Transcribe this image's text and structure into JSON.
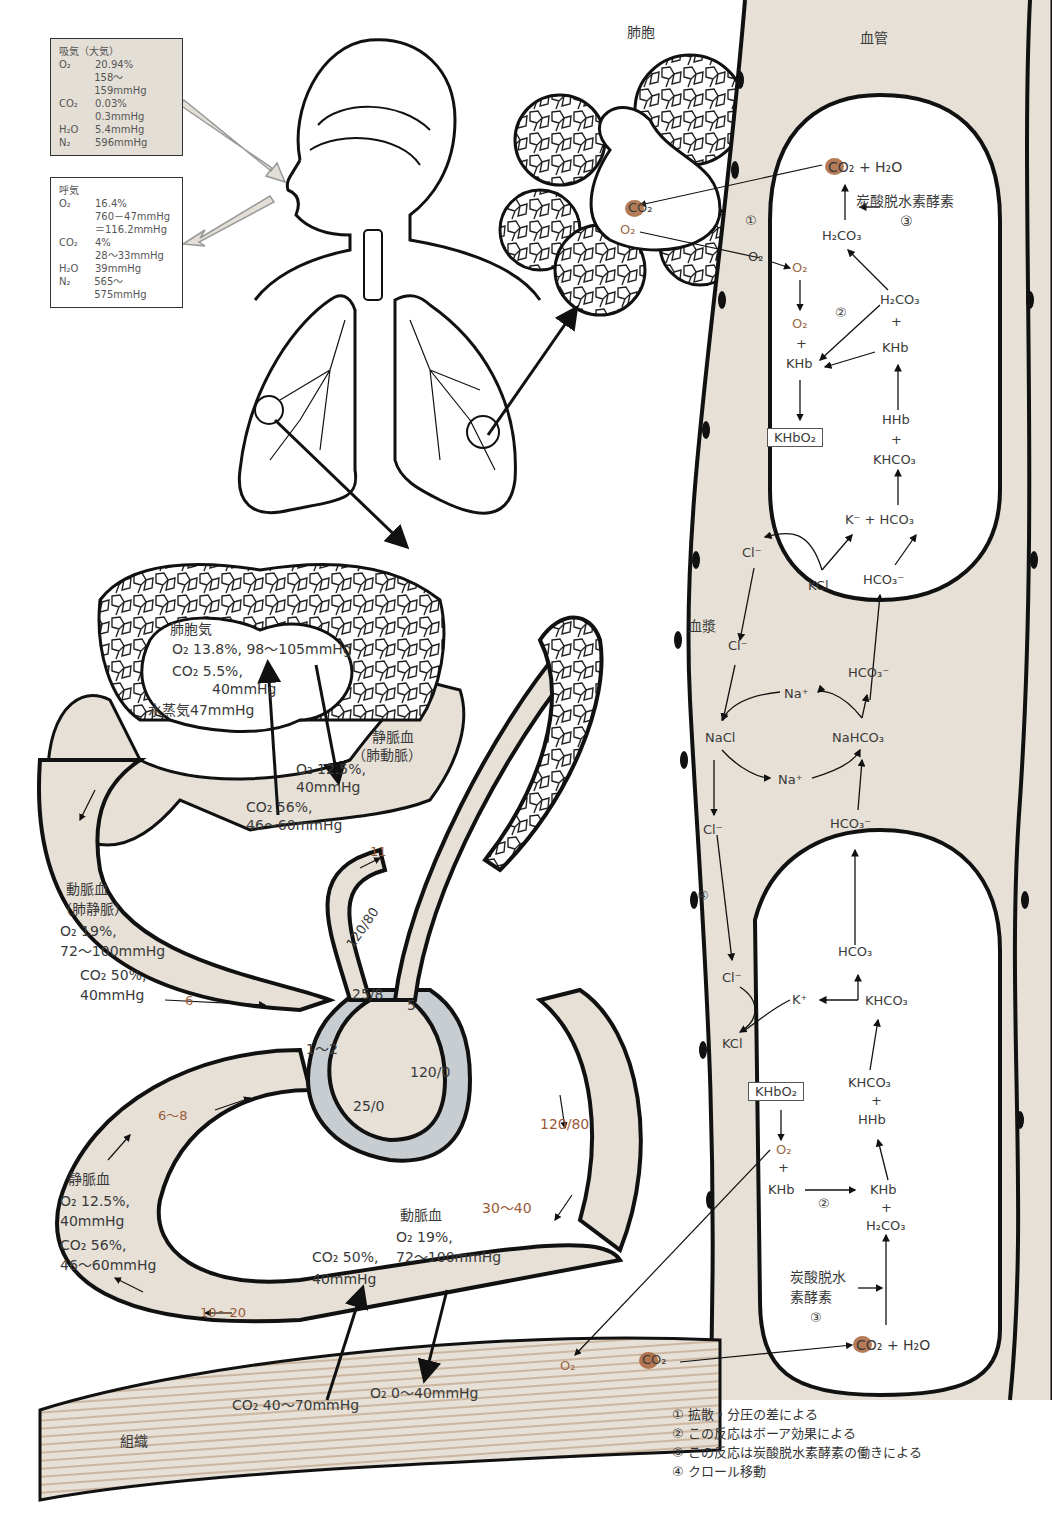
{
  "inhale_box": {
    "title": "吸気（大気）",
    "rows": [
      {
        "k": "O₂",
        "v": "20.94%"
      },
      {
        "k": "",
        "v": "158～159mmHg"
      },
      {
        "k": "CO₂",
        "v": "0.03%"
      },
      {
        "k": "",
        "v": "0.3mmHg"
      },
      {
        "k": "H₂O",
        "v": "5.4mmHg"
      },
      {
        "k": "N₂",
        "v": "596mmHg"
      }
    ]
  },
  "exhale_box": {
    "title": "呼気",
    "rows": [
      {
        "k": "O₂",
        "v": "16.4%"
      },
      {
        "k": "",
        "v": "760－47mmHg"
      },
      {
        "k": "",
        "v": "＝116.2mmHg"
      },
      {
        "k": "CO₂",
        "v": "4%"
      },
      {
        "k": "",
        "v": "28～33mmHg"
      },
      {
        "k": "H₂O",
        "v": "39mmHg"
      },
      {
        "k": "N₂",
        "v": "565～575mmHg"
      }
    ]
  },
  "top_labels": {
    "alveolus": "肺胞",
    "vessel": "血管",
    "plasma": "血漿"
  },
  "alveolar_air": {
    "title": "肺胞気",
    "o2": "O₂ 13.8%, 98～105mmHg",
    "co2": "CO₂ 5.5%,",
    "co2_mmhg": "40mmHg",
    "water": "水蒸気47mmHg"
  },
  "pulmonary_artery": {
    "title": "静脈血",
    "sub": "（肺動脈）",
    "o2": "O₂ 12.5%,",
    "o2_mmhg": "40mmHg",
    "co2": "CO₂ 56%,",
    "co2_mmhg": "46～60mmHg"
  },
  "pulmonary_vein": {
    "title": "動脈血",
    "sub": "（肺静脈）",
    "o2": "O₂ 19%,",
    "o2_mmhg": "72～100mmHg",
    "co2": "CO₂ 50%,",
    "co2_mmhg": "40mmHg"
  },
  "systemic_vein": {
    "title": "静脈血",
    "o2": "O₂ 12.5%,",
    "o2_mmhg": "40mmHg",
    "co2": "CO₂ 56%,",
    "co2_mmhg": "46～60mmHg"
  },
  "systemic_artery": {
    "title": "動脈血",
    "o2": "O₂ 19%,",
    "o2_mmhg": "72～100mmHg",
    "co2": "CO₂ 50%,",
    "co2_mmhg": "40mmHg"
  },
  "tissue": {
    "label": "組織",
    "co2": "CO₂ 40～70mmHg",
    "o2": "O₂ 0～40mmHg"
  },
  "pressures": {
    "p11": "11",
    "p6": "6",
    "p120_80_top": "120/80",
    "p25_8": "25/8",
    "p5": "5",
    "p1_2": "1～2",
    "p120_0": "120/0",
    "p25_0": "25/0",
    "p6_8": "6～8",
    "p120_80": "120/80",
    "p30_40": "30～40",
    "p10_20": "10～20"
  },
  "upper_cell": {
    "co2_h2o": "+ H₂O",
    "enzyme": "炭酸脱水素酵素",
    "enzyme_num": "③",
    "h2co3": "H₂CO₃",
    "o2_a": "O₂",
    "o2_b": "O₂",
    "plus": "+",
    "khb": "KHb",
    "reaction_num": "②",
    "h2co3_b": "H₂CO₃",
    "khb_b": "KHb",
    "hhb": "HHb",
    "khco3": "KHCO₃",
    "khbo2": "KHbO₂",
    "k_minus": "K⁻ + HCO₃",
    "cl_minus": "Cl⁻",
    "kcl": "KCl",
    "hco3_minus": "HCO₃⁻",
    "alv_co2": "CO₂",
    "alv_o2": "O₂",
    "diff_o2": "O₂",
    "diff_num": "①"
  },
  "plasma_flow": {
    "cl_a": "Cl⁻",
    "na_top": "Na⁺",
    "nacl": "NaCl",
    "na_bottom": "Na⁺",
    "nahco3": "NaHCO₃",
    "hco3_top": "HCO₃⁻",
    "hco3_bottom": "HCO₃⁻",
    "cl_b": "Cl⁻",
    "chloride_num": "④"
  },
  "lower_cell": {
    "hco3": "HCO₃",
    "cl_minus": "Cl⁻",
    "k_plus": "K⁺",
    "khco3_a": "KHCO₃",
    "kcl": "KCl",
    "khco3_b": "KHCO₃",
    "plus1": "+",
    "hhb": "HHb",
    "khbo2": "KHbO₂",
    "o2": "O₂",
    "plus2": "+",
    "khb": "KHb",
    "reaction_num": "②",
    "khb_b": "KHb",
    "plus3": "+",
    "h2co3": "H₂CO₃",
    "enzyme_l1": "炭酸脱水",
    "enzyme_l2": "素酵素",
    "enzyme_num": "③",
    "co2_h2o": "+ H₂O",
    "tissue_o2": "O₂",
    "tissue_co2": "CO₂"
  },
  "legend": [
    "① 拡散・分圧の差による",
    "② この反応はボーア効果による",
    "③ この反応は炭酸脱水素酵素の働きによる",
    "④ クロール移動"
  ],
  "colors": {
    "fill": "#e6e0d6",
    "co2_dot": "#a8643a",
    "pressure_text": "#9a5a3a",
    "heart_wall": "#c8cdd2",
    "outline": "#111111"
  }
}
